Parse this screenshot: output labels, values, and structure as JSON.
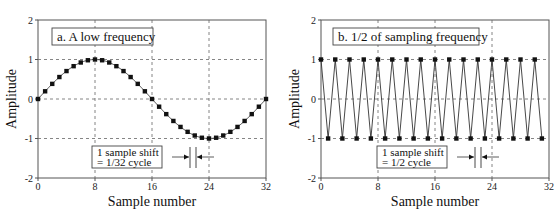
{
  "chart_data": [
    {
      "type": "line",
      "panel": "a",
      "title": "a.  A low frequency",
      "xlabel": "Sample number",
      "ylabel": "Amplitude",
      "xlim": [
        0,
        32
      ],
      "ylim": [
        -2,
        2
      ],
      "xticks": [
        0,
        8,
        16,
        24,
        32
      ],
      "yticks": [
        2,
        1,
        0,
        -1,
        -2
      ],
      "grid": "dashed",
      "markers": "square",
      "series": [
        {
          "name": "sin(2*pi*n/32)",
          "x": [
            0,
            1,
            2,
            3,
            4,
            5,
            6,
            7,
            8,
            9,
            10,
            11,
            12,
            13,
            14,
            15,
            16,
            17,
            18,
            19,
            20,
            21,
            22,
            23,
            24,
            25,
            26,
            27,
            28,
            29,
            30,
            31,
            32
          ],
          "values": [
            0,
            0.195,
            0.383,
            0.556,
            0.707,
            0.831,
            0.924,
            0.981,
            1,
            0.981,
            0.924,
            0.831,
            0.707,
            0.556,
            0.383,
            0.195,
            0,
            -0.195,
            -0.383,
            -0.556,
            -0.707,
            -0.831,
            -0.924,
            -0.981,
            -1,
            -0.981,
            -0.924,
            -0.831,
            -0.707,
            -0.556,
            -0.383,
            -0.195,
            0
          ]
        }
      ],
      "annotation": {
        "line1": "1 sample shift",
        "line2": "= 1/32 cycle",
        "shift_between_samples": [
          21,
          22
        ]
      }
    },
    {
      "type": "line",
      "panel": "b",
      "title": "b.  1/2 of sampling frequency",
      "xlabel": "Sample number",
      "ylabel": "Amplitude",
      "xlim": [
        0,
        32
      ],
      "ylim": [
        -2,
        2
      ],
      "xticks": [
        0,
        8,
        16,
        24,
        32
      ],
      "yticks": [
        2,
        1,
        0,
        -1,
        -2
      ],
      "grid": "dashed",
      "markers": "square",
      "series": [
        {
          "name": "cos(pi*n)",
          "x": [
            0,
            1,
            2,
            3,
            4,
            5,
            6,
            7,
            8,
            9,
            10,
            11,
            12,
            13,
            14,
            15,
            16,
            17,
            18,
            19,
            20,
            21,
            22,
            23,
            24,
            25,
            26,
            27,
            28,
            29,
            30,
            31
          ],
          "values": [
            1,
            -1,
            1,
            -1,
            1,
            -1,
            1,
            -1,
            1,
            -1,
            1,
            -1,
            1,
            -1,
            1,
            -1,
            1,
            -1,
            1,
            -1,
            1,
            -1,
            1,
            -1,
            1,
            -1,
            1,
            -1,
            1,
            -1,
            1,
            -1
          ]
        }
      ],
      "annotation": {
        "line1": "1 sample shift",
        "line2": "= 1/2 cycle",
        "shift_between_samples": [
          21,
          22
        ]
      }
    }
  ]
}
